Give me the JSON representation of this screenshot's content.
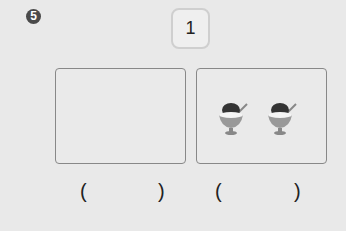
{
  "problem": {
    "number": "5",
    "top_value": "1"
  },
  "boxes": [
    {
      "label": "left-box",
      "items": 0
    },
    {
      "label": "right-box",
      "items": 2,
      "item_type": "shaved-ice-bowl"
    }
  ],
  "answers": {
    "open": "(",
    "close": ")"
  }
}
